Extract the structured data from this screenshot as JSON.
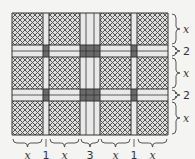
{
  "diagram": {
    "colors": {
      "background": "#f4f4f2",
      "patch_fill": "#d9d9d9",
      "hatch": "#555555",
      "path": "#e9e9e9",
      "intersection": "#6a6a6a",
      "outline": "#333333"
    },
    "columns": [
      {
        "label": "x",
        "kind": "patch",
        "units": "x"
      },
      {
        "label": "1",
        "kind": "path",
        "units": 1
      },
      {
        "label": "x",
        "kind": "patch",
        "units": "x"
      },
      {
        "label": "3",
        "kind": "path",
        "units": 3
      },
      {
        "label": "x",
        "kind": "patch",
        "units": "x"
      },
      {
        "label": "1",
        "kind": "path",
        "units": 1
      },
      {
        "label": "x",
        "kind": "patch",
        "units": "x"
      }
    ],
    "rows": [
      {
        "label": "x",
        "kind": "patch",
        "units": "x"
      },
      {
        "label": "2",
        "kind": "path",
        "units": 2
      },
      {
        "label": "x",
        "kind": "patch",
        "units": "x"
      },
      {
        "label": "2",
        "kind": "path",
        "units": 2
      },
      {
        "label": "x",
        "kind": "patch",
        "units": "x"
      }
    ]
  }
}
